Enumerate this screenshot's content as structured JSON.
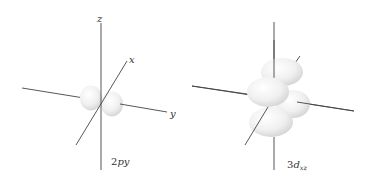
{
  "figure": {
    "background": "#ffffff",
    "line_color": "#444444",
    "lobe_fill": "#f2f2f2",
    "panels": [
      {
        "orbital": "2py",
        "label_main": "2",
        "label_italic": "py",
        "axes": {
          "z": "z",
          "x": "x",
          "y": "y"
        }
      },
      {
        "orbital": "3dxz",
        "label_main": "3",
        "label_italic": "d",
        "label_subscript": "xz"
      }
    ]
  }
}
